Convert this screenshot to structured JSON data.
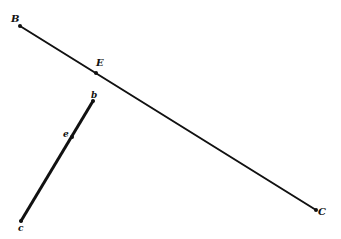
{
  "diagram": {
    "ink_color": "#111111",
    "background": "#ffffff",
    "segments": [
      {
        "id": "BC",
        "from": "B",
        "to": "C",
        "width": 2
      },
      {
        "id": "bc",
        "from": "b",
        "to": "c",
        "width": 3
      }
    ],
    "points": {
      "B": {
        "label": "B",
        "x": 20,
        "y": 26,
        "lx": 11,
        "ly": 22
      },
      "E": {
        "label": "E",
        "x": 96,
        "y": 73,
        "lx": 96,
        "ly": 66
      },
      "C": {
        "label": "C",
        "x": 316,
        "y": 210,
        "lx": 318,
        "ly": 215
      },
      "b": {
        "label": "b",
        "x": 93,
        "y": 101,
        "lx": 91,
        "ly": 98
      },
      "e": {
        "label": "e",
        "x": 72,
        "y": 137,
        "lx": 63,
        "ly": 137
      },
      "c": {
        "label": "c",
        "x": 21,
        "y": 221,
        "lx": 18,
        "ly": 231
      }
    }
  }
}
